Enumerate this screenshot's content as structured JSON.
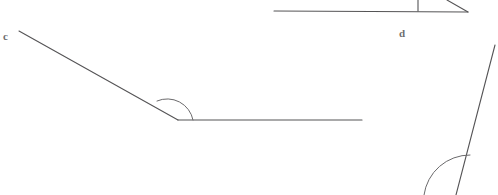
{
  "figure": {
    "background_color": "#ffffff",
    "stroke_color": "#555456",
    "arc_color": "#6b6a6c",
    "label_color": "#6e6d70",
    "width": 498,
    "height": 195
  },
  "labels": {
    "c": "c",
    "d": "d"
  },
  "shapes": {
    "angle_c": {
      "name": "obtuse-angle-c",
      "vertex": [
        178,
        120
      ],
      "ray_1_end": [
        19,
        31
      ],
      "ray_2_end": [
        362,
        120
      ],
      "arc_path": "M 157 101 A 26 26 0 0 1 193 120",
      "arc_radius": 26
    },
    "angle_d": {
      "name": "angle-d-top-partial",
      "baseline_start": [
        274,
        11
      ],
      "baseline_end": [
        468,
        12
      ],
      "tick_top": [
        418,
        0
      ],
      "tick_bottom": [
        418,
        11
      ],
      "ray_end": [
        447,
        0
      ],
      "ray_vertex": [
        468,
        12
      ]
    },
    "angle_bottom_right": {
      "name": "angle-bottom-right-partial",
      "ray_top": [
        495,
        45
      ],
      "ray_bottom": [
        456,
        195
      ],
      "arc_path": "M 470 155 A 46 46 0 0 0 424 195",
      "arc_radius": 46
    }
  }
}
